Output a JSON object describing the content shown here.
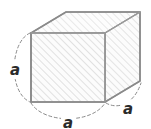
{
  "figure": {
    "name": "cube-with-equal-edge-labels",
    "background_color": "#ffffff"
  },
  "colors": {
    "outline": "#8c8c8c",
    "outline_dark": "#6e6e6e",
    "hatch": "#d6d6d6",
    "face_fill": "#fbfbfb",
    "top_face_fill": "#fdfdfd",
    "label_text": "#2b2b2b",
    "dimension_arc": "#8a8a8a"
  },
  "shape": {
    "type": "cube",
    "faces": [
      {
        "id": "front",
        "name": "front-face",
        "hatched": true
      },
      {
        "id": "top",
        "name": "top-face",
        "hatched": true
      },
      {
        "id": "right",
        "name": "right-face",
        "hatched": true
      }
    ],
    "geometry": {
      "front_face": {
        "x": 31,
        "y": 33,
        "width": 74,
        "height": 69
      },
      "depth_offset": {
        "dx": 35,
        "dy": -21
      }
    },
    "hatch": {
      "angle_deg": 45,
      "spacing_px": 4,
      "line_width_px": 1
    }
  },
  "dimensions": [
    {
      "id": "left",
      "name": "dimension-label-height",
      "label": "a",
      "edge": "vertical-left",
      "arc_style": "dashed",
      "position": {
        "x": 15,
        "y": 70
      }
    },
    {
      "id": "bottom",
      "name": "dimension-label-width",
      "label": "a",
      "edge": "horizontal-bottom",
      "arc_style": "dashed",
      "position": {
        "x": 68,
        "y": 123
      }
    },
    {
      "id": "right",
      "name": "dimension-label-depth",
      "label": "a",
      "edge": "diagonal-depth",
      "arc_style": "dashed",
      "position": {
        "x": 128,
        "y": 109
      }
    }
  ]
}
